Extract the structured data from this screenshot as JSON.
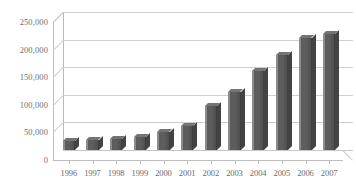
{
  "chart_data": {
    "type": "bar",
    "title": "",
    "subtitle": "",
    "xlabel": "",
    "ylabel": "",
    "categories": [
      "1996",
      "1997",
      "1998",
      "1999",
      "2000",
      "2001",
      "2002",
      "2003",
      "2004",
      "2005",
      "2006",
      "2007"
    ],
    "values": [
      16000,
      18000,
      20000,
      23000,
      32000,
      43000,
      80000,
      105000,
      143000,
      172000,
      203000,
      210000
    ],
    "series": [
      {
        "name": "",
        "values": [
          16000,
          18000,
          20000,
          23000,
          32000,
          43000,
          80000,
          105000,
          143000,
          172000,
          203000,
          210000
        ]
      }
    ],
    "ylim": [
      0,
      250000
    ],
    "y_ticks": [
      0,
      50000,
      100000,
      150000,
      200000,
      250000
    ],
    "y_tick_labels": [
      "0",
      "50,000",
      "100,000",
      "150,000",
      "200,000",
      "250,000"
    ],
    "x_tick_labels": [
      "1996",
      "1997",
      "1998",
      "1999",
      "2000",
      "2001",
      "2002",
      "2003",
      "2004",
      "2005",
      "2006",
      "2007"
    ],
    "grid": true,
    "grid_axis": "y",
    "legend": false,
    "legend_position": "none",
    "style": "3d-column",
    "bar_color": "#595959",
    "bar_top_color": "#747474",
    "bar_side_color": "#434343",
    "gridline_color": "#cfcfcf",
    "axis_color": "#bdbdbd",
    "label_color": "#6b6b6b",
    "background_color": "#ffffff",
    "annotations": []
  }
}
